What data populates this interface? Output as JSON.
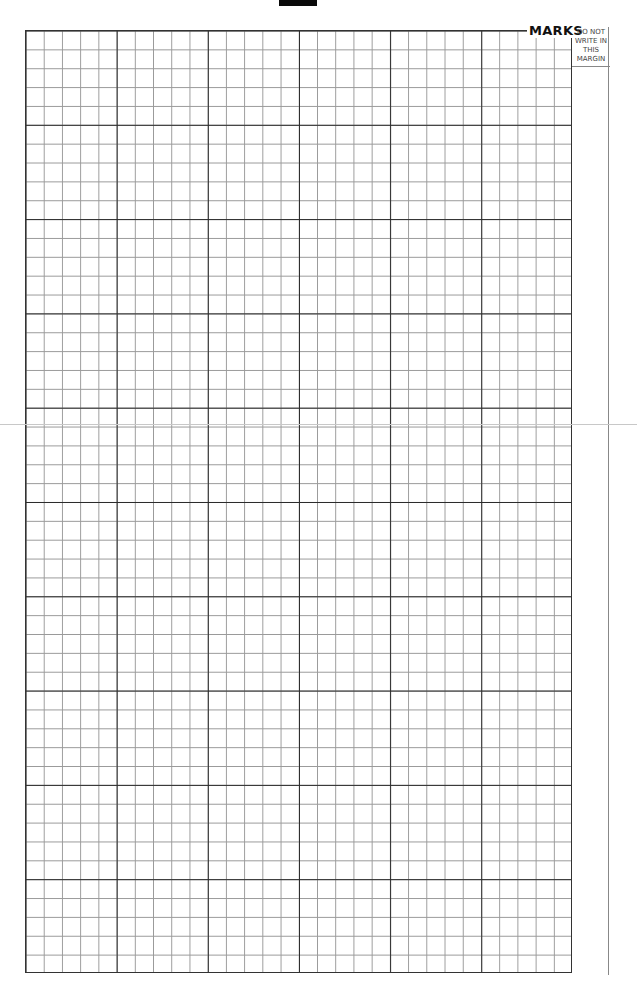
{
  "page": {
    "type": "graph-paper answer sheet",
    "grid": {
      "major_columns": 6,
      "major_rows": 10,
      "minor_per_major": 5,
      "minor_columns": 30,
      "minor_rows": 50,
      "major_line_color": "#2a2a2a",
      "minor_line_color": "#9a9a9a"
    },
    "header": {
      "marks_label": "MARKS"
    },
    "margin": {
      "text": "DO NOT\nWRITE IN\nTHIS\nMARGIN"
    },
    "colors": {
      "background": "#ffffff",
      "top_tab": "#0a0a0a",
      "seam_line": "#c8c8c8"
    }
  }
}
